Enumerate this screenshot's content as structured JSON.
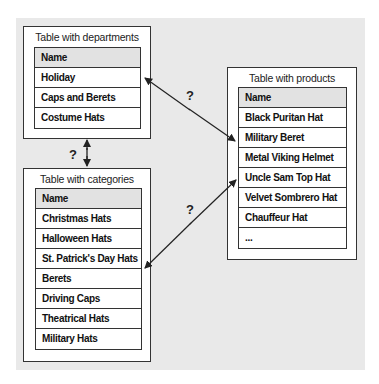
{
  "diagram": {
    "tables": [
      {
        "id": "departments",
        "caption": "Table with departments",
        "header": "Name",
        "rows": [
          "Holiday",
          "Caps and Berets",
          "Costume Hats"
        ]
      },
      {
        "id": "categories",
        "caption": "Table with categories",
        "header": "Name",
        "rows": [
          "Christmas Hats",
          "Halloween Hats",
          "St. Patrick's Day Hats",
          "Berets",
          "Driving Caps",
          "Theatrical Hats",
          "Military Hats"
        ]
      },
      {
        "id": "products",
        "caption": "Table with products",
        "header": "Name",
        "rows": [
          "Black Puritan Hat",
          "Military Beret",
          "Metal Viking Helmet",
          "Uncle Sam Top Hat",
          "Velvet Sombrero Hat",
          "Chauffeur Hat",
          "..."
        ]
      }
    ],
    "relations": [
      {
        "from": "departments",
        "to": "categories",
        "label": "?"
      },
      {
        "from": "departments",
        "to": "products",
        "label": "?"
      },
      {
        "from": "categories",
        "to": "products",
        "label": "?"
      }
    ],
    "colors": {
      "background": "#e9e9e9",
      "header_fill": "#e2e2e2",
      "line": "#333333"
    }
  }
}
